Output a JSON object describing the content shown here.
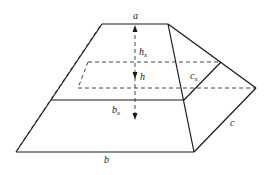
{
  "figure": {
    "labels": {
      "top_edge": "a",
      "bottom_edge": "b",
      "side_edge": "c",
      "height": "h",
      "height_x": {
        "base": "h",
        "sub": "x"
      },
      "section_width": {
        "base": "b",
        "sub": "x"
      },
      "section_depth": {
        "base": "c",
        "sub": "x"
      }
    },
    "colors": {
      "line": "#1a1a1a",
      "background": "#ffffff"
    }
  }
}
